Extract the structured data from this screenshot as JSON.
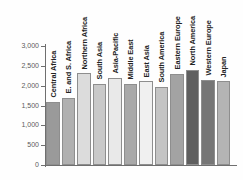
{
  "chart_data": {
    "type": "bar",
    "title": "",
    "subtitle": "",
    "xlabel": "",
    "ylabel": "",
    "ylim": [
      0,
      3000
    ],
    "grid": false,
    "legend": "none",
    "y_ticks": [
      "0",
      "500",
      "1,000",
      "1,500",
      "2,000",
      "2,500",
      "3,000"
    ],
    "y_tick_values": [
      0,
      500,
      1000,
      1500,
      2000,
      2500,
      3000
    ],
    "categories": [
      "Central Africa",
      "E. and S. Africa",
      "Northern Africa",
      "South Asia",
      "Asia-Pacific",
      "Middle East",
      "East Asia",
      "South America",
      "Eastern Europe",
      "North America",
      "Western Europe",
      "Japan"
    ],
    "values": [
      1600,
      1700,
      2320,
      2050,
      2200,
      2050,
      2120,
      1970,
      2300,
      2400,
      2150,
      2120
    ],
    "bar_colors": [
      "#9a9a9a",
      "#b0b0b0",
      "#dcdcdc",
      "#c9c9c9",
      "#e9e9e9",
      "#a9a9a9",
      "#f0f0f0",
      "#c4c4c4",
      "#a3a3a3",
      "#5f5f5f",
      "#767676",
      "#b4b4b4"
    ]
  },
  "axis": {
    "y_axis_color": "#6f6f6f",
    "x_axis_color": "#6f6f6f",
    "tick_text_color": "#5b5b5b"
  },
  "canvas": {
    "background": "#fefefe"
  }
}
